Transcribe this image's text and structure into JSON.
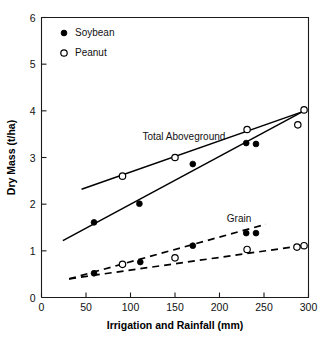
{
  "chart_data": {
    "type": "scatter",
    "title": "",
    "xlabel": "Irrigation and Rainfall (mm)",
    "ylabel": "Dry Mass (t/ha)",
    "xlim": [
      0,
      300
    ],
    "ylim": [
      0,
      6
    ],
    "xticks": [
      0,
      50,
      100,
      150,
      200,
      250,
      300
    ],
    "yticks": [
      0,
      1,
      2,
      3,
      4,
      5,
      6
    ],
    "xtick_labels": [
      "0",
      "50",
      "100",
      "150",
      "200",
      "250",
      "300"
    ],
    "ytick_labels": [
      "0",
      "1",
      "2",
      "3",
      "4",
      "5",
      "6"
    ],
    "grid": false,
    "legend_position": "upper-left-inside",
    "legend": [
      {
        "label": "Soybean",
        "marker": "filled-circle"
      },
      {
        "label": "Peanut",
        "marker": "open-circle"
      }
    ],
    "annotations": [
      {
        "text": "Total Aboveground",
        "x": 160,
        "y": 3.38
      },
      {
        "text": "Grain",
        "x": 222,
        "y": 1.62
      }
    ],
    "series": [
      {
        "name": "Soybean Total Aboveground",
        "marker": "filled-circle",
        "line": "solid",
        "points": [
          {
            "x": 59,
            "y": 1.61
          },
          {
            "x": 110,
            "y": 2.01
          },
          {
            "x": 170,
            "y": 2.86
          },
          {
            "x": 230,
            "y": 3.31
          },
          {
            "x": 241,
            "y": 3.29
          }
        ],
        "fit_line": [
          {
            "x": 24,
            "y": 1.22
          },
          {
            "x": 296,
            "y": 4.01
          }
        ]
      },
      {
        "name": "Peanut Total Aboveground",
        "marker": "open-circle",
        "line": "solid",
        "points": [
          {
            "x": 91,
            "y": 2.6
          },
          {
            "x": 150,
            "y": 3.0
          },
          {
            "x": 231,
            "y": 3.6
          },
          {
            "x": 288,
            "y": 3.7
          },
          {
            "x": 295,
            "y": 4.02
          }
        ],
        "fit_line": [
          {
            "x": 45,
            "y": 2.32
          },
          {
            "x": 296,
            "y": 4.0
          }
        ]
      },
      {
        "name": "Soybean Grain",
        "marker": "filled-circle",
        "line": "dashed",
        "points": [
          {
            "x": 59,
            "y": 0.52
          },
          {
            "x": 111,
            "y": 0.76
          },
          {
            "x": 170,
            "y": 1.11
          },
          {
            "x": 230,
            "y": 1.38
          },
          {
            "x": 241,
            "y": 1.38
          }
        ],
        "fit_line": [
          {
            "x": 31,
            "y": 0.4
          },
          {
            "x": 252,
            "y": 1.57
          }
        ]
      },
      {
        "name": "Peanut Grain",
        "marker": "open-circle",
        "line": "dashed",
        "points": [
          {
            "x": 91,
            "y": 0.71
          },
          {
            "x": 150,
            "y": 0.85
          },
          {
            "x": 231,
            "y": 1.03
          },
          {
            "x": 287,
            "y": 1.08
          },
          {
            "x": 295,
            "y": 1.11
          }
        ],
        "fit_line": [
          {
            "x": 31,
            "y": 0.4
          },
          {
            "x": 296,
            "y": 1.12
          }
        ]
      }
    ]
  }
}
